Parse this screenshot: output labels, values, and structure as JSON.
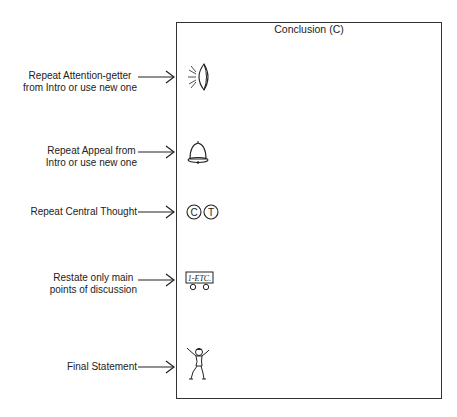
{
  "diagram": {
    "box_title": "Conclusion (C)",
    "rows": [
      {
        "label_lines": [
          "Repeat Attention-getter",
          "from Intro or use new one"
        ],
        "icon": "flashlight-icon"
      },
      {
        "label_lines": [
          "Repeat Appeal from",
          "Intro or use new one"
        ],
        "icon": "bell-icon"
      },
      {
        "label_lines": [
          "Repeat Central Thought"
        ],
        "icon": "ct-circles-icon",
        "icon_text": [
          "C",
          "T"
        ]
      },
      {
        "label_lines": [
          "Restate only main",
          "points of discussion"
        ],
        "icon": "wagon-icon",
        "icon_text": "1-ETC."
      },
      {
        "label_lines": [
          "Final Statement"
        ],
        "icon": "cheering-figure-icon"
      }
    ]
  }
}
